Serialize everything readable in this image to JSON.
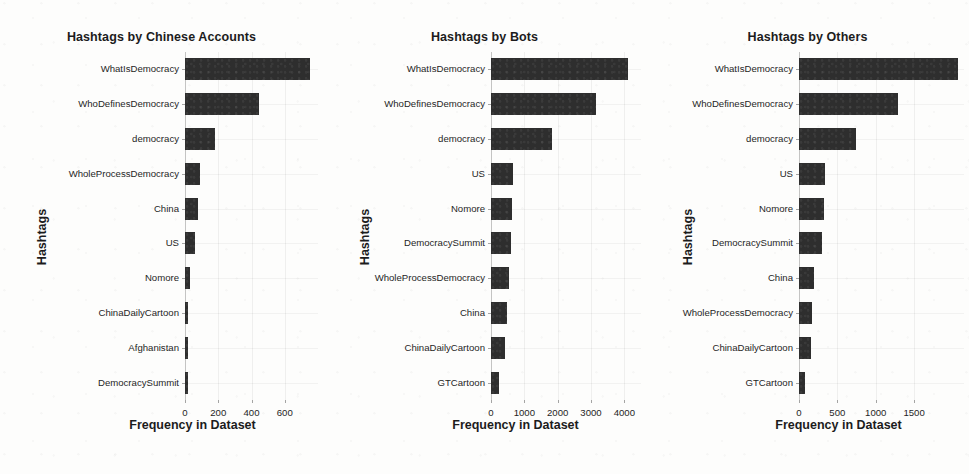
{
  "figure": {
    "width": 969,
    "height": 474,
    "bar_color": "#2e2e2e",
    "background": "#fdfdfc"
  },
  "chart_data": [
    {
      "type": "bar",
      "orientation": "horizontal",
      "title": "Hashtags by Chinese Accounts",
      "xlabel": "Frequency in Dataset",
      "ylabel": "Hashtags",
      "categories": [
        "WhatIsDemocracy",
        "WhoDefinesDemocracy",
        "democracy",
        "WholeProcessDemocracy",
        "China",
        "US",
        "Nomore",
        "ChinaDailyCartoon",
        "Afghanistan",
        "DemocracySummit"
      ],
      "values": [
        750,
        444,
        180,
        88,
        77,
        60,
        33,
        11,
        6,
        5
      ],
      "xticks": [
        0,
        200,
        400,
        600
      ],
      "xlim": [
        0,
        800
      ],
      "grid": true,
      "legend": "none"
    },
    {
      "type": "bar",
      "orientation": "horizontal",
      "title": "Hashtags by Bots",
      "xlabel": "Frequency in Dataset",
      "ylabel": "Hashtags",
      "categories": [
        "WhatIsDemocracy",
        "WhoDefinesDemocracy",
        "democracy",
        "US",
        "Nomore",
        "DemocracySummit",
        "WholeProcessDemocracy",
        "China",
        "ChinaDailyCartoon",
        "GTCartoon"
      ],
      "values": [
        4100,
        3150,
        1820,
        660,
        630,
        600,
        540,
        480,
        420,
        240
      ],
      "xticks": [
        0,
        1000,
        2000,
        3000,
        4000
      ],
      "xlim": [
        0,
        4500
      ],
      "grid": true,
      "legend": "none"
    },
    {
      "type": "bar",
      "orientation": "horizontal",
      "title": "Hashtags by Others",
      "xlabel": "Frequency in Dataset",
      "ylabel": "Hashtags",
      "categories": [
        "WhatIsDemocracy",
        "WhoDefinesDemocracy",
        "democracy",
        "US",
        "Nomore",
        "DemocracySummit",
        "China",
        "WholeProcessDemocracy",
        "ChinaDailyCartoon",
        "GTCartoon"
      ],
      "values": [
        2070,
        1290,
        740,
        340,
        320,
        300,
        190,
        175,
        160,
        75
      ],
      "xticks": [
        0,
        500,
        1000,
        1500
      ],
      "xlim": [
        0,
        2150
      ],
      "grid": true,
      "legend": "none"
    }
  ]
}
